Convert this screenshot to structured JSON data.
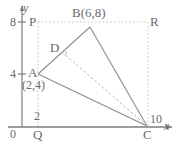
{
  "figure": {
    "kind": "coordinate-geometry-diagram",
    "colors": {
      "ink": "#6b6b6b",
      "axis": "#7a7a7a",
      "solid_line": "#8a8a8a",
      "dotted_line": "#c0c0c0",
      "dashed_line": "#b0b0b0",
      "background": "#ffffff"
    },
    "axes": {
      "x_label": "x",
      "y_label": "y",
      "origin_label": "0",
      "x_ticks": [
        {
          "label": "2",
          "value": 2
        },
        {
          "label": "10",
          "value": 10
        }
      ],
      "y_ticks": [
        {
          "label": "4",
          "value": 4
        },
        {
          "label": "8",
          "value": 8
        }
      ]
    },
    "points": [
      {
        "name": "P",
        "label": "P",
        "x": 2,
        "y": 8
      },
      {
        "name": "B",
        "label": "B(6,8)",
        "x": 6,
        "y": 8
      },
      {
        "name": "R",
        "label": "R",
        "x": 10,
        "y": 8
      },
      {
        "name": "D",
        "label": "D",
        "x": 4.1,
        "y": 6.05
      },
      {
        "name": "A",
        "label": "A",
        "x": 2,
        "y": 4
      },
      {
        "name": "Ac",
        "label": "(2,4)",
        "x": 2,
        "y": 4
      },
      {
        "name": "Q",
        "label": "Q",
        "x": 2,
        "y": 0
      },
      {
        "name": "C",
        "label": "C",
        "x": 10,
        "y": 0
      }
    ],
    "segments": [
      {
        "name": "A-B",
        "style": "solid",
        "from": "A",
        "to": "B"
      },
      {
        "name": "B-C",
        "style": "solid",
        "from": "B",
        "to": "C"
      },
      {
        "name": "A-C",
        "style": "solid",
        "from": "A",
        "to": "C"
      },
      {
        "name": "D-C",
        "style": "dashed",
        "from": "D",
        "to": "C"
      },
      {
        "name": "P-B-R",
        "style": "dotted",
        "from": "P",
        "to": "R"
      },
      {
        "name": "P-Q",
        "style": "dotted",
        "from": "P",
        "to": "Q"
      },
      {
        "name": "R-C",
        "style": "dotted",
        "from": "R",
        "to": "C"
      }
    ],
    "marks": [
      {
        "name": "right-angle-at-D",
        "at": "D"
      }
    ]
  }
}
